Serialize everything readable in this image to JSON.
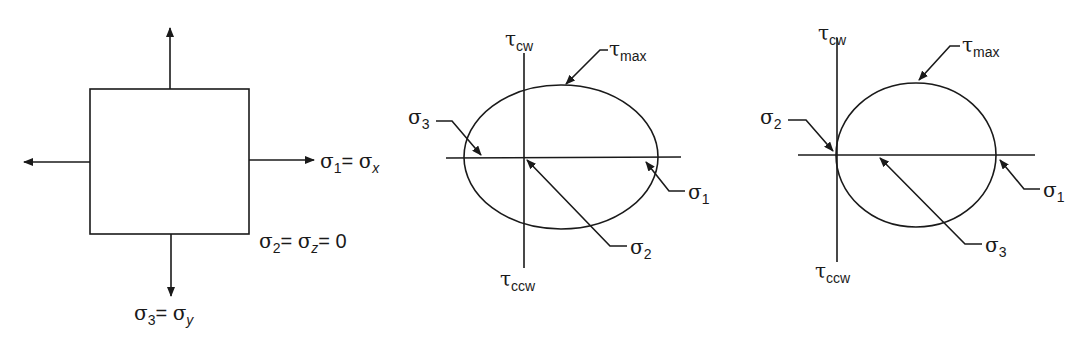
{
  "figure": {
    "panels": [
      {
        "id": "stress-element",
        "labels": {
          "sigma1": {
            "sym": "σ",
            "sub": "1",
            "eq": "= ",
            "rhs_sym": "σ",
            "rhs_sub": "x"
          },
          "sigma2": {
            "sym": "σ",
            "sub": "2",
            "eq": "= ",
            "rhs_sym": "σ",
            "rhs_sub": "z",
            "tail": "= 0"
          },
          "sigma3": {
            "sym": "σ",
            "sub": "3",
            "eq": "= ",
            "rhs_sym": "σ",
            "rhs_sub": "y"
          }
        }
      },
      {
        "id": "mohr-circle-1",
        "axis_top": {
          "sym": "τ",
          "sub": "cw"
        },
        "axis_bottom": {
          "sym": "τ",
          "sub": "ccw"
        },
        "callouts": {
          "tau_max": {
            "sym": "τ",
            "sub": "max"
          },
          "left": {
            "sym": "σ",
            "sub": "3"
          },
          "right": {
            "sym": "σ",
            "sub": "1"
          },
          "origin": {
            "sym": "σ",
            "sub": "2"
          }
        }
      },
      {
        "id": "mohr-circle-2",
        "axis_top": {
          "sym": "τ",
          "sub": "cw"
        },
        "axis_bottom": {
          "sym": "τ",
          "sub": "ccw"
        },
        "callouts": {
          "tau_max": {
            "sym": "τ",
            "sub": "max"
          },
          "left": {
            "sym": "σ",
            "sub": "2"
          },
          "right": {
            "sym": "σ",
            "sub": "1"
          },
          "center": {
            "sym": "σ",
            "sub": "3"
          }
        }
      }
    ]
  }
}
